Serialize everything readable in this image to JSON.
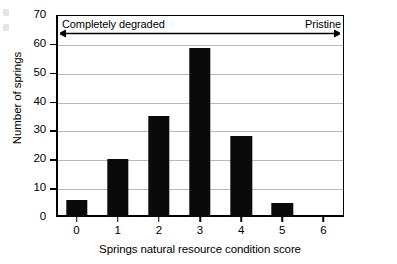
{
  "chart_data": {
    "type": "bar",
    "title": "",
    "xlabel": "Springs natural resource condition score",
    "ylabel": "Number of springs",
    "categories": [
      "0",
      "1",
      "2",
      "3",
      "4",
      "5",
      "6"
    ],
    "values": [
      6,
      20,
      35,
      58.5,
      28,
      5,
      0
    ],
    "ylim": [
      0,
      70
    ],
    "ytick_labels": [
      "0",
      "10",
      "20",
      "30",
      "40",
      "50",
      "60",
      "70"
    ],
    "ytick_values": [
      0,
      10,
      20,
      30,
      40,
      50,
      60,
      70
    ],
    "xtick_labels": [
      "0",
      "1",
      "2",
      "3",
      "4",
      "5",
      "6"
    ],
    "grid": "horizontal",
    "legend": "none",
    "bar_color": "#0a0a0a",
    "grid_color": "#b9b9b9",
    "axis_color": "#000000",
    "annotations": [
      {
        "text": "Completely degraded",
        "position": "top-left"
      },
      {
        "text": "Pristine",
        "position": "top-right"
      }
    ],
    "arrow": {
      "name": "condition-gradient-arrow",
      "style": "double-headed",
      "direction": "horizontal"
    }
  }
}
